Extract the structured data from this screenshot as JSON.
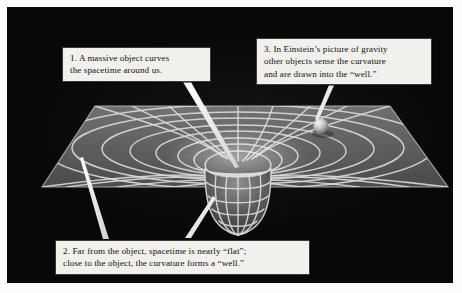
{
  "figure": {
    "background_color": "#080808",
    "sheet_color": "#5a5a5a",
    "grid_color": "#d8d8d8",
    "callout_box_color": "#f2f0ec",
    "leader_line_color": "#f0f0ee"
  },
  "callouts": [
    {
      "id": "callout-1",
      "number": "1.",
      "text": "1.  A massive object curves\nthe spacetime around us.",
      "points_to": "center-of-well"
    },
    {
      "id": "callout-2",
      "number": "2.",
      "text": "2.  Far from the object, spacetime is nearly “flat”;\nclose to the object, the curvature forms a “well.”",
      "points_to": "flat-sheet-edge-and-well-wall"
    },
    {
      "id": "callout-3",
      "number": "3.",
      "text": "3.  In Einstein’s picture of gravity\nother objects sense the curvature\nand are drawn into the “well.”",
      "points_to": "orbiting-sphere"
    }
  ],
  "scene": {
    "sheet_label": "curved spacetime sheet",
    "well_label": "gravity well funnel",
    "sphere_label": "test object sphere"
  }
}
